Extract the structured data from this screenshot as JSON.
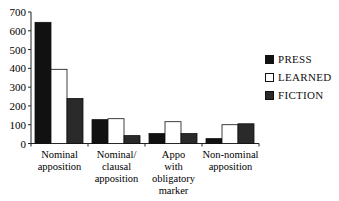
{
  "chart_data": {
    "type": "bar",
    "title": "",
    "xlabel": "",
    "ylabel": "",
    "ylim": [
      0,
      700
    ],
    "yticks": [
      0,
      100,
      200,
      300,
      400,
      500,
      600,
      700
    ],
    "grid": false,
    "legend_position": "right",
    "categories": [
      [
        "Nominal",
        "apposition"
      ],
      [
        "Nominal/",
        "clausal",
        "apposition"
      ],
      [
        "Appo",
        "with",
        "obligatory",
        "marker"
      ],
      [
        "Non-nominal",
        "apposition"
      ]
    ],
    "category_labels": [
      "Nominal apposition",
      "Nominal/ clausal apposition",
      "Appo with obligatory marker",
      "Non-nominal apposition"
    ],
    "series": [
      {
        "name": "PRESS",
        "color": "#111111",
        "values": [
          645,
          127,
          53,
          26
        ]
      },
      {
        "name": "LEARNED",
        "color": "#ffffff",
        "values": [
          395,
          132,
          116,
          100
        ]
      },
      {
        "name": "FICTION",
        "color": "#2a2a2a",
        "values": [
          240,
          42,
          53,
          105
        ]
      }
    ]
  },
  "legend": {
    "items": [
      {
        "label": "PRESS",
        "color": "#111111"
      },
      {
        "label": "LEARNED",
        "color": "#ffffff"
      },
      {
        "label": "FICTION",
        "color": "#2a2a2a"
      }
    ]
  }
}
